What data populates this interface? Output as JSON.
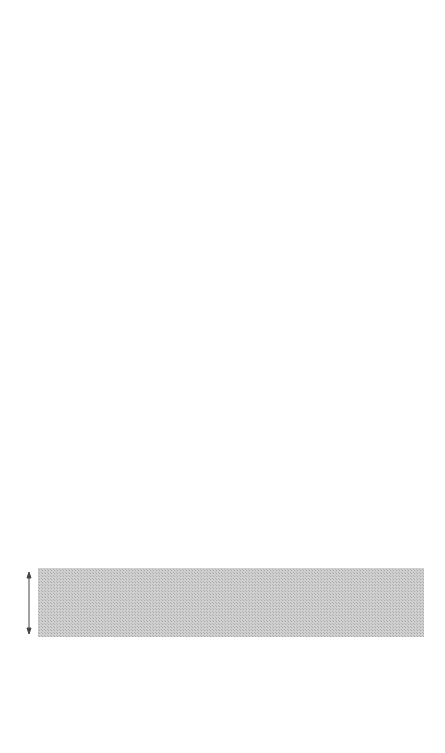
{
  "caption": {
    "figure_label": "Figure 8.2",
    "lines": [
      {
        "bold": "Figure 8.2",
        "text": " A maximum parsimony–"
      },
      {
        "text": "based topology for Andropadus using"
      },
      {
        "text": "sequences of Cytochrome b (575 bp)"
      },
      {
        "text": "and ND2 (296 bp) combined, and"
      },
      {
        "text": "branch lengths according to sequence"
      },
      {
        "text": "divergence (see Roy 1997 for bootstrap"
      },
      {
        "text": "values and a full evaluation). A time"
      },
      {
        "text": "estimate is given assuming 10%"
      },
      {
        "text": "sequence divergence per MYA up until"
      },
      {
        "text": "3 MYA. Because of transition"
      },
      {
        "text": "saturation, there is a lack of linearity"
      },
      {
        "text": "between overall divergence and time,"
      },
      {
        "text": "and we therefore used transversions"
      },
      {
        "text": "only below 3 MYA, assuming a rate of"
      },
      {
        "text": "0.5% per MYA. However, at this level of"
      },
      {
        "text": "evolutionary divergence transversion"
      },
      {
        "text": "accumulation between clades and time"
      },
      {
        "text": "estimation had a high variance, which"
      },
      {
        "text": "decreased above 12 MYA. The split"
      },
      {
        "text": "between highland and lowland forms"
      },
      {
        "text": "may have been 18–32 MYA, and the"
      },
      {
        "text": "lowland forms diverged from one"
      },
      {
        "text": "another 12–28 MYA (Roy 1997)."
      }
    ]
  },
  "axis": {
    "labels": [
      {
        "label": "1Ma",
        "y": 424
      },
      {
        "label": "2Ma",
        "y": 495
      },
      {
        "label": "3Ma",
        "y": 568
      },
      {
        "label": "20Ma",
        "y": 637
      }
    ],
    "band_color": "#c9c9c9"
  },
  "taxa": [
    {
      "name": "A. masukuensis roehli, S. Pare",
      "x": 33
    },
    {
      "name": "A. masukuensis roehli, E. Usumbara",
      "x": 49
    },
    {
      "name": "A. masukuensis roehli, Nguru",
      "x": 65
    },
    {
      "name": "A. masukuensis roehli, Uluguru",
      "x": 81
    },
    {
      "name": "A. masukuensis roehli, N. Udzungwa",
      "x": 97
    },
    {
      "name": "A. masukuensis roehli, S.E. Udzungwa",
      "x": 112
    },
    {
      "name": "A. masukuensis masukuensis, Rungwe",
      "x": 129
    },
    {
      "name": "A. masukuensis kakamegae, Kenya",
      "x": 145
    },
    {
      "name": "A. tephrolaemus tephrolaemus, Cameroon",
      "x": 169
    },
    {
      "name": "A. montanus, Cameroon",
      "x": 195
    },
    {
      "name": "A. tephrolaemus neumanni, Uluguru",
      "x": 210
    },
    {
      "name": "A. tephrolaemus chlorigula, Udzungwa",
      "x": 227
    },
    {
      "name": "A. tephrolaemus fusciceps, Mt Rungwe",
      "x": 244
    },
    {
      "name": "A. tephrolaemus nigriceps, Mt Meru",
      "x": 262
    },
    {
      "name": "A. tephrolaemus usambarae, S. Pare",
      "x": 277
    },
    {
      "name": "A. tephrolaemus kikuyensis, Rwenzori",
      "x": 297
    },
    {
      "name": "A. milanjensis striifacies, Uluguru",
      "x": 310
    },
    {
      "name": "A. milanjensis striifacies, Udzungwa",
      "x": 326
    },
    {
      "name": "A. virens, Uganda",
      "x": 341
    },
    {
      "name": "A. virens, Cameroon",
      "x": 357
    },
    {
      "name": "A. latirostris, Uganda",
      "x": 376
    },
    {
      "name": "A. importunus, Kenya",
      "x": 394
    },
    {
      "name": "A. curvirostris, Uganda",
      "x": 407
    },
    {
      "name": "P. flavostriatus, Tanzania",
      "x": 424
    }
  ],
  "tips_y": 358
}
